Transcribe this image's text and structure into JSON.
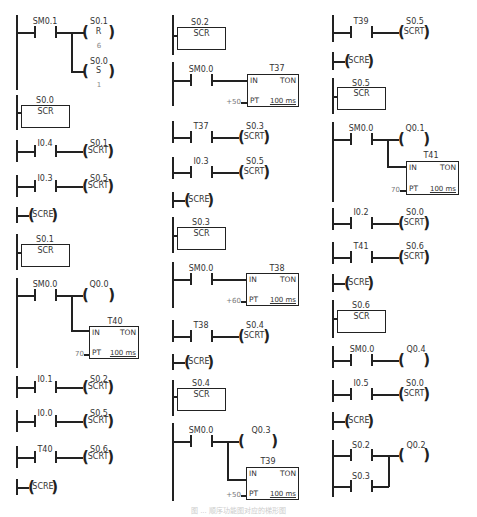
{
  "figure": {
    "caption": "图 ... 顺序功能图对应的梯形图",
    "columns": [
      {
        "networks": [
          {
            "type": "contact-to-coils",
            "contact": "SM0.1",
            "coils": [
              {
                "addr": "S0.1",
                "op": "R",
                "n": "6"
              },
              {
                "addr": "S0.0",
                "op": "S",
                "n": "1"
              }
            ]
          },
          {
            "type": "scr",
            "addr": "S0.0",
            "label": "SCR"
          },
          {
            "type": "contact-coil",
            "contact": "I0.4",
            "coil": "S0.1",
            "op": "SCRT"
          },
          {
            "type": "contact-coil",
            "contact": "I0.3",
            "coil": "S0.5",
            "op": "SCRT"
          },
          {
            "type": "scre",
            "label": "SCRE"
          },
          {
            "type": "scr",
            "addr": "S0.1",
            "label": "SCR"
          },
          {
            "type": "contact-coil-timer",
            "contact": "SM0.0",
            "coil": "Q0.0",
            "timer": {
              "name": "T40",
              "in": "IN",
              "kind": "TON",
              "pt_label": "PT",
              "pt_value": "70",
              "base": "100 ms"
            }
          },
          {
            "type": "contact-coil",
            "contact": "I0.1",
            "coil": "S0.2",
            "op": "SCRT"
          },
          {
            "type": "contact-coil",
            "contact": "I0.0",
            "coil": "S0.5",
            "op": "SCRT"
          },
          {
            "type": "contact-coil",
            "contact": "T40",
            "coil": "S0.6",
            "op": "SCRT"
          },
          {
            "type": "scre",
            "label": "SCRE"
          }
        ]
      },
      {
        "networks": [
          {
            "type": "scr",
            "addr": "S0.2",
            "label": "SCR"
          },
          {
            "type": "contact-timer",
            "contact": "SM0.0",
            "timer": {
              "name": "T37",
              "in": "IN",
              "kind": "TON",
              "pt_label": "PT",
              "pt_value": "+50",
              "base": "100 ms"
            }
          },
          {
            "type": "contact-coil",
            "contact": "T37",
            "coil": "S0.3",
            "op": "SCRT"
          },
          {
            "type": "contact-coil",
            "contact": "I0.3",
            "coil": "S0.5",
            "op": "SCRT"
          },
          {
            "type": "scre",
            "label": "SCRE"
          },
          {
            "type": "scr",
            "addr": "S0.3",
            "label": "SCR"
          },
          {
            "type": "contact-timer",
            "contact": "SM0.0",
            "timer": {
              "name": "T38",
              "in": "IN",
              "kind": "TON",
              "pt_label": "PT",
              "pt_value": "+60",
              "base": "100 ms"
            }
          },
          {
            "type": "contact-coil",
            "contact": "T38",
            "coil": "S0.4",
            "op": "SCRT"
          },
          {
            "type": "scre",
            "label": "SCRE"
          },
          {
            "type": "scr",
            "addr": "S0.4",
            "label": "SCR"
          },
          {
            "type": "contact-coil-timer",
            "contact": "SM0.0",
            "coil": "Q0.3",
            "timer": {
              "name": "T39",
              "in": "IN",
              "kind": "TON",
              "pt_label": "PT",
              "pt_value": "+50",
              "base": "100 ms"
            }
          }
        ]
      },
      {
        "networks": [
          {
            "type": "contact-coil",
            "contact": "T39",
            "coil": "S0.5",
            "op": "SCRT"
          },
          {
            "type": "scre",
            "label": "SCRE"
          },
          {
            "type": "scr",
            "addr": "S0.5",
            "label": "SCR"
          },
          {
            "type": "contact-coil-timer",
            "contact": "SM0.0",
            "coil": "Q0.1",
            "timer": {
              "name": "T41",
              "in": "IN",
              "kind": "TON",
              "pt_label": "PT",
              "pt_value": "70",
              "base": "100 ms"
            }
          },
          {
            "type": "contact-coil",
            "contact": "I0.2",
            "coil": "S0.0",
            "op": "SCRT"
          },
          {
            "type": "contact-coil",
            "contact": "T41",
            "coil": "S0.6",
            "op": "SCRT"
          },
          {
            "type": "scre",
            "label": "SCRE"
          },
          {
            "type": "scr",
            "addr": "S0.6",
            "label": "SCR"
          },
          {
            "type": "contact-coil",
            "contact": "SM0.0",
            "coil": "Q0.4",
            "op": ""
          },
          {
            "type": "contact-coil",
            "contact": "I0.5",
            "coil": "S0.0",
            "op": "SCRT"
          },
          {
            "type": "scre",
            "label": "SCRE"
          },
          {
            "type": "parallel-contacts-coil",
            "contacts": [
              "S0.2",
              "S0.3"
            ],
            "coil": "Q0.2",
            "op": ""
          }
        ]
      }
    ]
  },
  "c1": {
    "n1": {
      "contact": "SM0.1",
      "coil1": "S0.1",
      "op1": "R",
      "n1": "6",
      "coil2": "S0.0",
      "op2": "S",
      "n2": "1"
    },
    "n2": {
      "addr": "S0.0",
      "label": "SCR"
    },
    "n3": {
      "contact": "I0.4",
      "coil": "S0.1",
      "op": "SCRT"
    },
    "n4": {
      "contact": "I0.3",
      "coil": "S0.5",
      "op": "SCRT"
    },
    "n5": {
      "label": "SCRE"
    },
    "n6": {
      "addr": "S0.1",
      "label": "SCR"
    },
    "n7": {
      "contact": "SM0.0",
      "coil": "Q0.0",
      "timer": "T40",
      "in": "IN",
      "kind": "TON",
      "pt": "PT",
      "ptv": "70",
      "base": "100 ms"
    },
    "n8": {
      "contact": "I0.1",
      "coil": "S0.2",
      "op": "SCRT"
    },
    "n9": {
      "contact": "I0.0",
      "coil": "S0.5",
      "op": "SCRT"
    },
    "n10": {
      "contact": "T40",
      "coil": "S0.6",
      "op": "SCRT"
    },
    "n11": {
      "label": "SCRE"
    }
  },
  "c2": {
    "n1": {
      "addr": "S0.2",
      "label": "SCR"
    },
    "n2": {
      "contact": "SM0.0",
      "timer": "T37",
      "in": "IN",
      "kind": "TON",
      "pt": "PT",
      "ptv": "+50",
      "base": "100 ms"
    },
    "n3": {
      "contact": "T37",
      "coil": "S0.3",
      "op": "SCRT"
    },
    "n4": {
      "contact": "I0.3",
      "coil": "S0.5",
      "op": "SCRT"
    },
    "n5": {
      "label": "SCRE"
    },
    "n6": {
      "addr": "S0.3",
      "label": "SCR"
    },
    "n7": {
      "contact": "SM0.0",
      "timer": "T38",
      "in": "IN",
      "kind": "TON",
      "pt": "PT",
      "ptv": "+60",
      "base": "100 ms"
    },
    "n8": {
      "contact": "T38",
      "coil": "S0.4",
      "op": "SCRT"
    },
    "n9": {
      "label": "SCRE"
    },
    "n10": {
      "addr": "S0.4",
      "label": "SCR"
    },
    "n11": {
      "contact": "SM0.0",
      "coil": "Q0.3",
      "timer": "T39",
      "in": "IN",
      "kind": "TON",
      "pt": "PT",
      "ptv": "+50",
      "base": "100 ms"
    }
  },
  "c3": {
    "n1": {
      "contact": "T39",
      "coil": "S0.5",
      "op": "SCRT"
    },
    "n2": {
      "label": "SCRE"
    },
    "n3": {
      "addr": "S0.5",
      "label": "SCR"
    },
    "n4": {
      "contact": "SM0.0",
      "coil": "Q0.1",
      "timer": "T41",
      "in": "IN",
      "kind": "TON",
      "pt": "PT",
      "ptv": "70",
      "base": "100 ms"
    },
    "n5": {
      "contact": "I0.2",
      "coil": "S0.0",
      "op": "SCRT"
    },
    "n6": {
      "contact": "T41",
      "coil": "S0.6",
      "op": "SCRT"
    },
    "n7": {
      "label": "SCRE"
    },
    "n8": {
      "addr": "S0.6",
      "label": "SCR"
    },
    "n9": {
      "contact": "SM0.0",
      "coil": "Q0.4"
    },
    "n10": {
      "contact": "I0.5",
      "coil": "S0.0",
      "op": "SCRT"
    },
    "n11": {
      "label": "SCRE"
    },
    "n12": {
      "contact1": "S0.2",
      "contact2": "S0.3",
      "coil": "Q0.2"
    }
  }
}
